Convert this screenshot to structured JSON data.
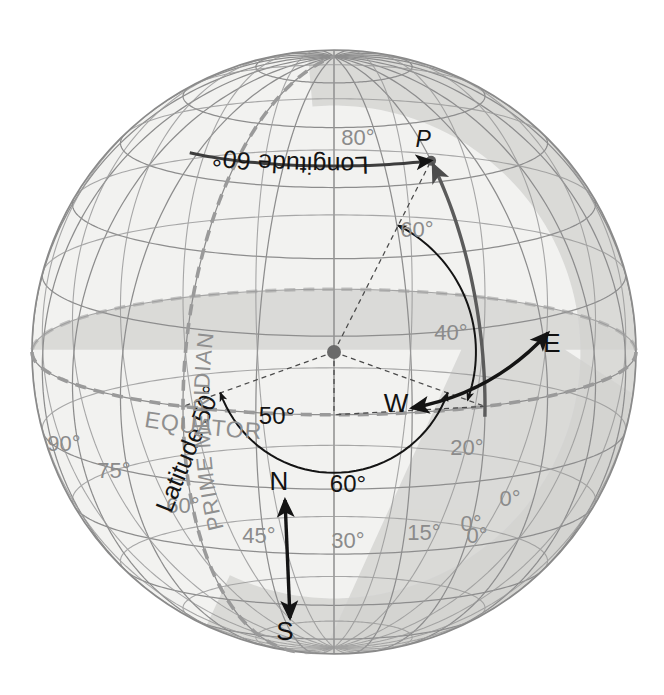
{
  "figure": {
    "background_color": "#ffffff",
    "globe": {
      "center_x": 334,
      "center_y": 352,
      "radius": 302,
      "fill_color": "#f2f2f0",
      "shadow_color": "#d6d6d4",
      "outline_color": "#8a8a8a",
      "grid_color": "#8e8e8e",
      "grid_spacing_degrees": 15,
      "view_center_longitude_deg": 30,
      "view_center_latitude_deg": 12
    },
    "colors": {
      "grid": "#8e8e8e",
      "accent_dark": "#1a1a1a",
      "accent_mid": "#585858",
      "label_gray": "#8b8b8b",
      "dashed_gray": "#9a9a9a",
      "shadow": "#d6d6d4",
      "globe_fill": "#f2f2f0"
    }
  },
  "labels": {
    "point_p": "P",
    "longitude_arc": "Longitude 60°",
    "latitude_arc": "Latitude 50°",
    "angle_latitude": "50°",
    "angle_longitude": "60°",
    "compass_north": "N",
    "compass_south": "S",
    "compass_east": "E",
    "compass_west": "W",
    "equator": "EQUATOR",
    "prime_meridian": "PRIME MERIDIAN"
  },
  "graticule_labels": {
    "latitude_on_prime_meridian": [
      {
        "text": "80°",
        "x": 358,
        "y": 145
      },
      {
        "text": "60°",
        "x": 417,
        "y": 237
      },
      {
        "text": "40°",
        "x": 451,
        "y": 340
      },
      {
        "text": "20°",
        "x": 467,
        "y": 455
      },
      {
        "text": "0°",
        "x": 471,
        "y": 531
      }
    ],
    "longitude_on_equator": [
      {
        "text": "90°",
        "x": 64,
        "y": 451
      },
      {
        "text": "75°",
        "x": 114,
        "y": 478
      },
      {
        "text": "60°",
        "x": 183,
        "y": 513
      },
      {
        "text": "45°",
        "x": 259,
        "y": 543
      },
      {
        "text": "30°",
        "x": 348,
        "y": 548
      },
      {
        "text": "15°",
        "x": 424,
        "y": 540
      },
      {
        "text": "0°",
        "x": 477,
        "y": 543
      }
    ]
  },
  "chart_data": {
    "type": "diagram",
    "projection": "orthographic",
    "point_P": {
      "latitude_deg": 50,
      "longitude_deg": 60,
      "label": "P"
    },
    "annotations": [
      {
        "name": "latitude-angle",
        "value_deg": 50,
        "label": "50°"
      },
      {
        "name": "longitude-angle",
        "value_deg": 60,
        "label": "60°"
      },
      {
        "name": "latitude-arc",
        "label": "Latitude 50°"
      },
      {
        "name": "longitude-arc",
        "label": "Longitude 60°"
      }
    ],
    "reference_lines": [
      "EQUATOR",
      "PRIME MERIDIAN"
    ],
    "meridian_ticks_deg": [
      0,
      15,
      30,
      45,
      60,
      75,
      90
    ],
    "parallel_ticks_deg": [
      0,
      20,
      40,
      60,
      80
    ]
  }
}
